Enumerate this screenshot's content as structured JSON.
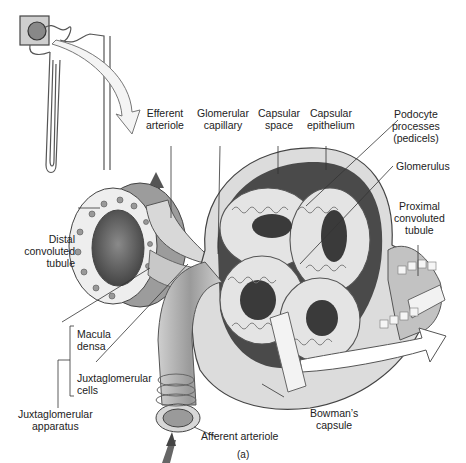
{
  "figure": {
    "caption": "(a)",
    "inset": "Nephron overview with boxed renal corpuscle"
  },
  "labels": {
    "efferent_arteriole": [
      "Efferent",
      "arteriole"
    ],
    "glomerular_capillary": [
      "Glomerular",
      "capillary"
    ],
    "capsular_space": [
      "Capsular",
      "space"
    ],
    "capsular_epithelium": [
      "Capsular",
      "epithelium"
    ],
    "podocyte_processes": [
      "Podocyte",
      "processes",
      "(pedicels)"
    ],
    "glomerulus": [
      "Glomerulus"
    ],
    "proximal_convoluted_tubule": [
      "Proximal",
      "convoluted",
      "tubule"
    ],
    "distal_convoluted_tubule": [
      "Distal",
      "convoluted",
      "tubule"
    ],
    "macula_densa": [
      "Macula",
      "densa"
    ],
    "juxtaglomerular_cells": [
      "Juxtaglomerular",
      "cells"
    ],
    "juxtaglomerular_apparatus": [
      "Juxtaglomerular",
      "apparatus"
    ],
    "bowmans_capsule": [
      "Bowman’s",
      "capsule"
    ],
    "afferent_arteriole": [
      "Afferent arteriole"
    ]
  },
  "colors": {
    "line": "#333333",
    "tissue_light": "#e6e6e6",
    "tissue_mid": "#b5b5b5",
    "tissue_dark": "#5a5a5a",
    "space_dark": "#4a4a4a"
  }
}
